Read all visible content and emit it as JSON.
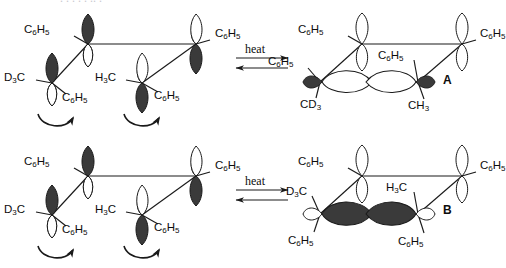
{
  "figure": {
    "type": "chemistry-mechanism-diagram",
    "background_color": "#ffffff",
    "orbital_dark_color": "#3a3a3a",
    "orbital_light_color": "#ffffff",
    "line_color": "#1a1a1a"
  },
  "top_bleed_text": ". .   .   .    .  ..    .",
  "reactions": [
    {
      "id": "reaction-top",
      "arrow": {
        "label": "heat",
        "kind": "equilibrium"
      },
      "reactant": {
        "id": "reactant-top",
        "labels": [
          {
            "name": "label-c6h5-top-left",
            "text": "C6H5"
          },
          {
            "name": "label-c6h5-top-right",
            "text": "C6H5"
          },
          {
            "name": "label-d3c-left",
            "text": "D3C"
          },
          {
            "name": "label-c6h5-bottom-left",
            "text": "C6H5"
          },
          {
            "name": "label-h3c-middle",
            "text": "H3C"
          },
          {
            "name": "label-c6h5-bottom-right",
            "text": "C6H5"
          }
        ],
        "rotation_arrows": 2
      },
      "product": {
        "id": "product-A",
        "letter": "A",
        "labels": [
          {
            "name": "label-c6h5-top-left",
            "text": "C6H5"
          },
          {
            "name": "label-c6h5-top-right",
            "text": "C6H5"
          },
          {
            "name": "label-c6h5-left",
            "text": "C6H5"
          },
          {
            "name": "label-cd3",
            "text": "CD3"
          },
          {
            "name": "label-c6h5-center",
            "text": "C6H5"
          },
          {
            "name": "label-ch3",
            "text": "CH3"
          }
        ]
      }
    },
    {
      "id": "reaction-bottom",
      "arrow": {
        "label": "heat",
        "kind": "equilibrium"
      },
      "reactant": {
        "id": "reactant-bottom",
        "labels": [
          {
            "name": "label-c6h5-top-left",
            "text": "C6H5"
          },
          {
            "name": "label-c6h5-top-right",
            "text": "C6H5"
          },
          {
            "name": "label-d3c-left",
            "text": "D3C"
          },
          {
            "name": "label-c6h5-bottom-left",
            "text": "C6H5"
          },
          {
            "name": "label-h3c-middle",
            "text": "H3C"
          },
          {
            "name": "label-c6h5-bottom-right",
            "text": "C6H5"
          }
        ],
        "rotation_arrows": 2
      },
      "product": {
        "id": "product-B",
        "letter": "B",
        "labels": [
          {
            "name": "label-c6h5-top-left",
            "text": "C6H5"
          },
          {
            "name": "label-c6h5-top-right",
            "text": "C6H5"
          },
          {
            "name": "label-d3c",
            "text": "D3C"
          },
          {
            "name": "label-c6h5-lower-left",
            "text": "C6H5"
          },
          {
            "name": "label-h3c",
            "text": "H3C"
          },
          {
            "name": "label-c6h5-lower-right",
            "text": "C6H5"
          }
        ]
      }
    }
  ]
}
